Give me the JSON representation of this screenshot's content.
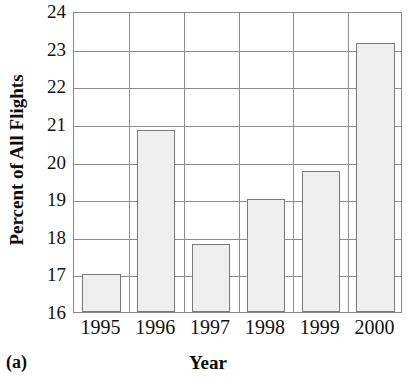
{
  "chart_data": {
    "type": "bar",
    "title": "",
    "xlabel": "Year",
    "ylabel": "Percent of All Flights",
    "panel_tag": "(a)",
    "categories": [
      "1995",
      "1996",
      "1997",
      "1998",
      "1999",
      "2000"
    ],
    "values": [
      17.0,
      20.85,
      17.8,
      19.0,
      19.75,
      23.15
    ],
    "ylim": [
      16,
      24
    ],
    "ytick_labels": [
      "24",
      "23",
      "22",
      "21",
      "20",
      "19",
      "18",
      "17",
      "16"
    ],
    "ytick_values": [
      24,
      23,
      22,
      21,
      20,
      19,
      18,
      17,
      16
    ],
    "grid": "horizontal-and-vertical",
    "legend": "none",
    "bar_color": "#efefef",
    "bar_edge_color": "#7a7a7a",
    "grid_color": "#8d8d8d",
    "axis_color": "#8a8a8a",
    "text_color": "#111111"
  }
}
